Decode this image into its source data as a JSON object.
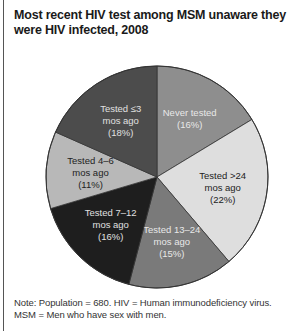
{
  "chart_data": {
    "type": "pie",
    "title": "Most recent HIV test among MSM unaware they were HIV infected, 2008",
    "start_angle": "12 o'clock, clockwise",
    "slices": [
      {
        "label": "Never tested",
        "line1": "Never tested",
        "line2": "",
        "pct_label": "(16%)",
        "value": 16,
        "color": "#8e8e8e",
        "text_color": "#e8e8e8"
      },
      {
        "label": "Tested >24 mos ago",
        "line1": "Tested >24",
        "line2": "mos ago",
        "pct_label": "(22%)",
        "value": 22,
        "color": "#dedede",
        "text_color": "#222222"
      },
      {
        "label": "Tested 13–24 mos ago",
        "line1": "Tested 13–24",
        "line2": "mos ago",
        "pct_label": "(15%)",
        "value": 15,
        "color": "#7a7a7a",
        "text_color": "#e8e8e8"
      },
      {
        "label": "Tested 7–12 mos ago",
        "line1": "Tested 7–12",
        "line2": "mos ago",
        "pct_label": "(16%)",
        "value": 16,
        "color": "#1e1e1e",
        "text_color": "#e0e0e0"
      },
      {
        "label": "Tested 4–6 mos ago",
        "line1": "Tested 4–6",
        "line2": "mos ago",
        "pct_label": "(11%)",
        "value": 11,
        "color": "#b8b8b8",
        "text_color": "#222222"
      },
      {
        "label": "Tested ≤3 mos ago",
        "line1": "Tested ≤3",
        "line2": "mos ago",
        "pct_label": "(18%)",
        "value": 18,
        "color": "#4c4c4c",
        "text_color": "#e0e0e0"
      }
    ],
    "note": "Note: Population = 680. HIV = Human immunodeficiency virus. MSM = Men who have sex with men."
  },
  "title": "Most recent HIV test among MSM unaware they were HIV infected, 2008",
  "note": {
    "line1": "Note: Population = 680. HIV = Human immunodeficiency virus.",
    "line2": "MSM = Men who have sex with men."
  }
}
